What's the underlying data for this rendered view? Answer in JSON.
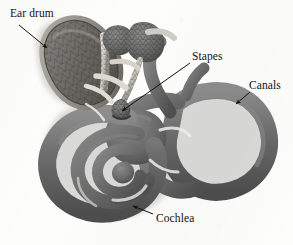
{
  "figure": {
    "width": 293,
    "height": 245,
    "background_color": "#fdfdfc",
    "style": "grayscale 3D rendered scientific illustration on scanned paper"
  },
  "palette": {
    "ink": "#14110f",
    "tube_mid": "#6f6f6f",
    "tube_dark": "#515151",
    "tube_light": "#8e8e8e",
    "shadow": "#c9c9c6",
    "mesh_line": "#3d3d3d",
    "eardrum_fill": "#6b6b6b",
    "eardrum_rim": "#4a4a4a",
    "bone_light": "#d8d5cf",
    "paper": "#fdfdfc"
  },
  "labels": [
    {
      "id": "ear-drum",
      "text": "Ear drum",
      "text_x": 10,
      "text_y": 8,
      "arrow": {
        "x1": 19,
        "y1": 25,
        "x2": 47,
        "y2": 48
      }
    },
    {
      "id": "stapes",
      "text": "Stapes",
      "text_x": 192,
      "text_y": 51,
      "arrow": {
        "x1": 190,
        "y1": 63,
        "x2": 122,
        "y2": 111
      }
    },
    {
      "id": "canals",
      "text": "Canals",
      "text_x": 249,
      "text_y": 80,
      "arrow": {
        "x1": 250,
        "y1": 92,
        "x2": 236,
        "y2": 104
      }
    },
    {
      "id": "cochlea",
      "text": "Cochlea",
      "text_x": 156,
      "text_y": 213,
      "arrow": {
        "x1": 153,
        "y1": 214,
        "x2": 133,
        "y2": 206
      }
    }
  ],
  "structures": [
    {
      "id": "ear-drum",
      "name": "Tympanic membrane (ear drum)",
      "description": "Large oval triangulated mesh membrane, upper left"
    },
    {
      "id": "ossicles",
      "name": "Ossicles (malleus, incus, stapes)",
      "description": "Small mesh-textured bones in the middle, upper center"
    },
    {
      "id": "stapes",
      "name": "Stapes",
      "description": "Smallest ossicle, seated at the oval window near center"
    },
    {
      "id": "canals",
      "name": "Semicircular canals",
      "description": "Large looping tube ring, right side"
    },
    {
      "id": "cochlea",
      "name": "Cochlea",
      "description": "Spiral coiled tube, lower left"
    },
    {
      "id": "vestibule",
      "name": "Vestibule",
      "description": "Junction between cochlea and canals, center"
    }
  ]
}
